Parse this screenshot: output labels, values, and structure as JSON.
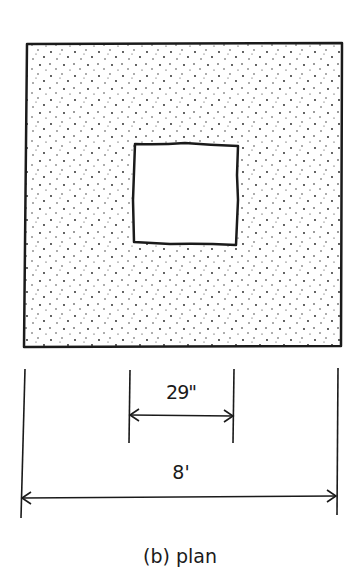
{
  "figure": {
    "caption": "(b) plan",
    "view": "plan",
    "outer_slab": {
      "fill": "stippled",
      "width_label": "8'"
    },
    "opening": {
      "fill": "empty",
      "width_label": "29\""
    }
  },
  "dimensions": {
    "opening_width": "29\"",
    "overall_width": "8'"
  },
  "colors": {
    "ink": "#1a1a1a",
    "background": "#ffffff"
  }
}
